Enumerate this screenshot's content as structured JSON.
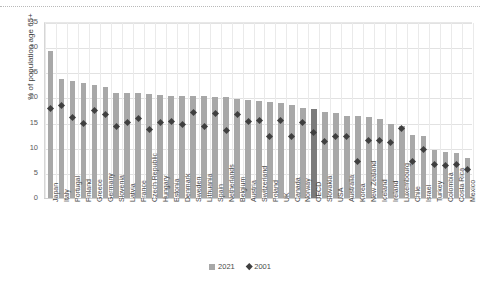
{
  "chart_data": {
    "type": "bar",
    "title": "",
    "xlabel": "",
    "ylabel": "% of population age 65+",
    "ylim": [
      0,
      35
    ],
    "yticks": [
      0,
      5,
      10,
      15,
      20,
      25,
      30,
      35
    ],
    "grid": true,
    "legend_position": "bottom",
    "categories": [
      "Japan",
      "Italy",
      "Portugal",
      "Finland",
      "Greece",
      "Germany",
      "Slovenia",
      "Latvia",
      "France",
      "Czech Republic",
      "Hungary",
      "Estonia",
      "Denmark",
      "Sweden",
      "Lithuania",
      "Spain",
      "Netherlands",
      "Belgium",
      "Austria",
      "Switzerland",
      "Poland",
      "UK",
      "Canada",
      "Norway",
      "OECD",
      "Slovakia",
      "USA",
      "Australia",
      "Korea",
      "New Zealand",
      "Iceland",
      "Ireland",
      "Luxembourg",
      "Chile",
      "Israel",
      "Turkey",
      "Colombia",
      "Costa Rica",
      "Mexico"
    ],
    "highlight_category": "OECD",
    "series": [
      {
        "name": "2021",
        "marker": "bar",
        "color": "#a8a8a8",
        "values": [
          29.2,
          23.6,
          23.2,
          22.8,
          22.5,
          22.0,
          20.8,
          20.8,
          20.8,
          20.6,
          20.4,
          20.3,
          20.3,
          20.3,
          20.2,
          20.1,
          20.0,
          19.7,
          19.4,
          19.2,
          19.0,
          18.9,
          18.4,
          17.9,
          17.8,
          17.1,
          16.9,
          16.4,
          16.3,
          16.2,
          15.8,
          14.8,
          14.4,
          12.6,
          12.3,
          9.6,
          9.2,
          9.0,
          7.9
        ]
      },
      {
        "name": "2001",
        "marker": "diamond",
        "color": "#3f3f3f",
        "values": [
          17.9,
          18.6,
          16.3,
          15.0,
          17.6,
          16.8,
          14.4,
          15.3,
          16.1,
          13.8,
          15.3,
          15.4,
          14.9,
          17.3,
          14.4,
          17.0,
          13.6,
          16.8,
          15.4,
          15.6,
          12.4,
          15.7,
          12.5,
          15.2,
          13.2,
          11.4,
          12.4,
          12.4,
          7.4,
          11.7,
          11.6,
          11.2,
          14.1,
          7.5,
          9.8,
          6.9,
          6.6,
          6.9,
          5.9
        ]
      }
    ]
  }
}
